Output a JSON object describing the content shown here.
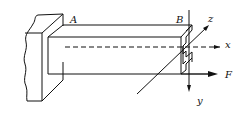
{
  "diagram": {
    "type": "cantilever beam with thin-walled channel end section",
    "labels": {
      "A": "A",
      "B": "B",
      "x": "x",
      "y": "y",
      "z": "z",
      "F": "F"
    },
    "colors": {
      "stroke": "#111111",
      "background": "#ffffff"
    }
  }
}
